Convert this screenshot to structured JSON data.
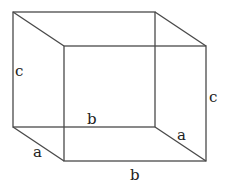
{
  "diagram": {
    "type": "rectangular-box-wireframe",
    "labels": {
      "back_left_height": "c",
      "front_right_height": "c",
      "back_bottom_width": "b",
      "front_bottom_width": "b",
      "left_depth": "a",
      "right_depth": "a"
    },
    "colors": {
      "edge": "#4a4a4a",
      "text": "#222222",
      "background": "#ffffff"
    }
  }
}
